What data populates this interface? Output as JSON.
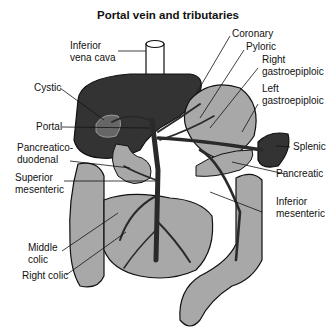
{
  "title": "Portal vein and tributaries",
  "labels": {
    "inferior_vena_cava": "Inferior\nvena cava",
    "coronary": "Coronary",
    "pyloric": "Pyloric",
    "right_gastroepiploic": "Right\ngastroepiploic",
    "left_gastroepiploic": "Left\ngastroepiploic",
    "cystic": "Cystic",
    "portal": "Portal",
    "splenic": "Splenic",
    "pancreaticoduodenal": "Pancreatico-\nduodenal",
    "pancreatic": "Pancreatic",
    "superior_mesenteric": "Superior\nmesenteric",
    "inferior_mesenteric": "Inferior\nmesenteric",
    "middle_colic": "Middle\ncolic",
    "right_colic": "Right colic"
  },
  "colors": {
    "liver": "#333333",
    "organ_fill": "#a8a8a8",
    "vein": "#2a2a2a",
    "outline": "#111111"
  }
}
